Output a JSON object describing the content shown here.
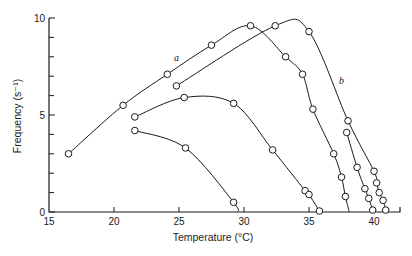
{
  "chart_data": {
    "type": "line",
    "title": "",
    "xlabel": "Temperature (°C)",
    "ylabel": "Frequency (s⁻¹)",
    "xlim": [
      15,
      42
    ],
    "ylim": [
      0,
      10
    ],
    "x_ticks": [
      15,
      20,
      25,
      30,
      35,
      40
    ],
    "y_ticks": [
      0,
      5,
      10
    ],
    "y_minor_ticks": [
      1,
      2,
      3,
      4,
      6,
      7,
      8,
      9
    ],
    "grid": false,
    "legend": null,
    "annotations": [
      {
        "text": "a",
        "x": 24.8,
        "y": 7.8
      },
      {
        "text": "b",
        "x": 37.5,
        "y": 6.6
      }
    ],
    "series": [
      {
        "name": "a",
        "points": [
          [
            16.5,
            3.0
          ],
          [
            20.7,
            5.5
          ],
          [
            24.1,
            7.1
          ],
          [
            27.5,
            8.6
          ],
          [
            30.5,
            9.6
          ],
          [
            33.2,
            8.0
          ],
          [
            34.5,
            7.1
          ],
          [
            35.3,
            5.3
          ],
          [
            36.9,
            3.0
          ],
          [
            37.5,
            1.8
          ],
          [
            37.8,
            0.8
          ]
        ],
        "line_end": [
          38.1,
          0.0
        ]
      },
      {
        "name": "b",
        "points": [
          [
            24.8,
            6.5
          ],
          [
            32.4,
            9.6
          ],
          [
            35.0,
            9.3
          ],
          [
            38.0,
            4.7
          ],
          [
            40.0,
            2.1
          ],
          [
            40.2,
            1.5
          ],
          [
            40.4,
            1.0
          ],
          [
            40.7,
            0.6
          ],
          [
            40.9,
            0.1
          ]
        ],
        "line_end": null
      },
      {
        "name": "c",
        "points": [
          [
            37.9,
            4.1
          ],
          [
            38.7,
            2.3
          ],
          [
            39.3,
            1.2
          ],
          [
            39.6,
            0.7
          ],
          [
            39.9,
            0.1
          ]
        ],
        "line_end": null
      },
      {
        "name": "d",
        "points": [
          [
            21.6,
            4.9
          ],
          [
            25.4,
            5.9
          ],
          [
            29.2,
            5.6
          ],
          [
            32.2,
            3.2
          ],
          [
            34.7,
            1.1
          ],
          [
            35.0,
            0.9
          ],
          [
            35.8,
            0.05
          ]
        ],
        "line_end": null
      },
      {
        "name": "e",
        "points": [
          [
            21.6,
            4.2
          ],
          [
            25.5,
            3.3
          ],
          [
            29.2,
            0.5
          ]
        ],
        "line_end": [
          29.5,
          0.0
        ]
      }
    ]
  },
  "layout": {
    "origin_px": [
      49,
      212
    ],
    "px_per_x": 13,
    "px_per_y": 19.4,
    "x_axis_end_px": 400
  }
}
